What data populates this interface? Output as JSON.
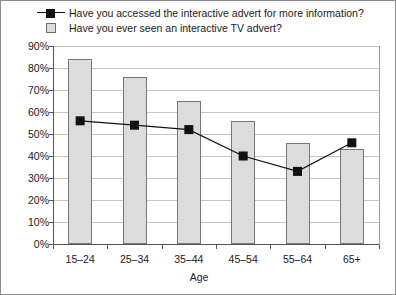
{
  "chart_data": {
    "type": "bar",
    "title": "",
    "subtitle": "",
    "xlabel": "Age",
    "ylabel": "",
    "categories": [
      "15–24",
      "25–34",
      "35–44",
      "45–54",
      "55–64",
      "65+"
    ],
    "ylim": [
      0,
      90
    ],
    "ytick_labels": [
      "90%",
      "80%",
      "70%",
      "60%",
      "50%",
      "40%",
      "30%",
      "20%",
      "10%",
      "0%"
    ],
    "ytick_values": [
      90,
      80,
      70,
      60,
      50,
      40,
      30,
      20,
      10,
      0
    ],
    "grid": true,
    "legend_position": "top-left",
    "series": [
      {
        "name": "Have you accessed the interactive advert for more information?",
        "type": "line",
        "marker": "square",
        "color": "#111111",
        "values": [
          56,
          54,
          52,
          40,
          33,
          46
        ]
      },
      {
        "name": "Have you ever seen an interactive TV advert?",
        "type": "bar",
        "color": "#dcdcdc",
        "border_color": "#787878",
        "values": [
          84,
          76,
          65,
          56,
          46,
          43
        ]
      }
    ]
  },
  "legend": {
    "items": [
      {
        "label": "Have you accessed the interactive advert for more information?",
        "key": "line-marker-key"
      },
      {
        "label": "Have you ever seen an interactive TV advert?",
        "key": "bar-swatch-key"
      }
    ]
  },
  "axes": {
    "x_title": "Age"
  }
}
